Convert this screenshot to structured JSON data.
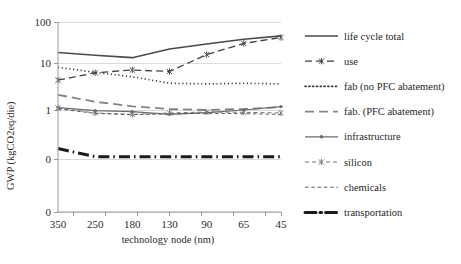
{
  "chart_data": {
    "type": "line",
    "title": "",
    "xlabel": "technology node (nm)",
    "ylabel": "GWP (kgCO2eq/die)",
    "x_tick_labels": [
      "350",
      "250",
      "180",
      "130",
      "90",
      "65",
      "45"
    ],
    "y_tick_labels": [
      "100",
      "10",
      "1",
      "0",
      "0"
    ],
    "y_scale": "log-like",
    "ylim": [
      0,
      100
    ],
    "grid": true,
    "legend_position": "right",
    "categories": [
      "350",
      "250",
      "180",
      "130",
      "90",
      "65",
      "45"
    ],
    "series": [
      {
        "name": "life cycle total",
        "style": "solid",
        "color": "#4a4a4a",
        "width": 1.6,
        "marker": "none",
        "values": [
          18,
          15.5,
          13.5,
          22,
          29,
          38,
          46
        ]
      },
      {
        "name": "use",
        "style": "dash-marker",
        "color": "#3f3f3f",
        "width": 1.3,
        "marker": "star",
        "values": [
          4.3,
          6.2,
          7.1,
          6.6,
          16,
          30,
          42
        ]
      },
      {
        "name": "fab (no PFC abatement)",
        "style": "dotted",
        "color": "#3a3a3a",
        "width": 1.6,
        "marker": "none",
        "values": [
          8.1,
          6.3,
          5.1,
          3.7,
          3.6,
          3.7,
          3.6
        ]
      },
      {
        "name": "fab. (PFC abatement)",
        "style": "longdash",
        "color": "#848484",
        "width": 1.8,
        "marker": "none",
        "values": [
          2.1,
          1.5,
          1.2,
          1.05,
          1.0,
          1.05,
          1.15
        ]
      },
      {
        "name": "infrastructure",
        "style": "solid-marker",
        "color": "#6a6a6a",
        "width": 1.2,
        "marker": "dot",
        "values": [
          1.12,
          0.95,
          0.88,
          0.72,
          0.82,
          1.0,
          1.18
        ]
      },
      {
        "name": "silicon",
        "style": "shortdash-marker",
        "color": "#777777",
        "width": 1.0,
        "marker": "star",
        "values": [
          1.1,
          0.8,
          0.72,
          0.8,
          0.86,
          0.84,
          0.8
        ]
      },
      {
        "name": "chemicals",
        "style": "shortdash",
        "color": "#5c5c5c",
        "width": 1.0,
        "marker": "none",
        "values": [
          1.05,
          0.78,
          0.7,
          0.75,
          0.78,
          0.76,
          0.72
        ]
      },
      {
        "name": "transportation",
        "style": "dashdot-thick",
        "color": "#1b1b1b",
        "width": 3.0,
        "marker": "none",
        "values": [
          0.055,
          0.03,
          0.03,
          0.03,
          0.03,
          0.03,
          0.03
        ]
      }
    ]
  },
  "legend": {
    "items": [
      {
        "label": "life cycle total"
      },
      {
        "label": "use"
      },
      {
        "label": "fab (no PFC abatement)"
      },
      {
        "label": "fab. (PFC abatement)"
      },
      {
        "label": "infrastructure"
      },
      {
        "label": "silicon"
      },
      {
        "label": "chemicals"
      },
      {
        "label": "transportation"
      }
    ]
  },
  "axes": {
    "y_title": "GWP (kgCO2eq/die)",
    "x_title": "technology node (nm)"
  }
}
